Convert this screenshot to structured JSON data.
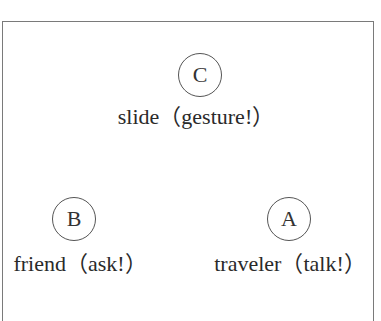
{
  "diagram": {
    "nodes": [
      {
        "id": "C",
        "letter": "C",
        "label": "slide（gesture!）"
      },
      {
        "id": "B",
        "letter": "B",
        "label": "friend（ask!）"
      },
      {
        "id": "A",
        "letter": "A",
        "label": "traveler（talk!）"
      }
    ]
  }
}
